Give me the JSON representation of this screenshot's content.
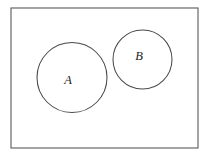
{
  "figure": {
    "kind": "venn-diagram",
    "background_color": "#ffffff",
    "stroke_color": "#4a4a4a",
    "label_color": "#1c1c1c"
  },
  "universe": {
    "name": "universe-box",
    "x": 11,
    "y": 8,
    "width": 187,
    "height": 140,
    "stroke": "#5a5a5a",
    "stroke_width": 1.1,
    "fill": "#ffffff",
    "label": ""
  },
  "sets": [
    {
      "id": "A",
      "label": "A",
      "cx": 72,
      "cy": 77.5,
      "r": 35,
      "label_x": 68,
      "label_y": 81,
      "stroke": "#4a4a4a",
      "stroke_width": 1.05,
      "fill": "none"
    },
    {
      "id": "B",
      "label": "B",
      "cx": 142.5,
      "cy": 59.5,
      "r": 29.5,
      "label_x": 139,
      "label_y": 57,
      "stroke": "#4a4a4a",
      "stroke_width": 1.05,
      "fill": "none"
    }
  ],
  "relationship": {
    "type": "disjoint",
    "intersection_label": ""
  }
}
